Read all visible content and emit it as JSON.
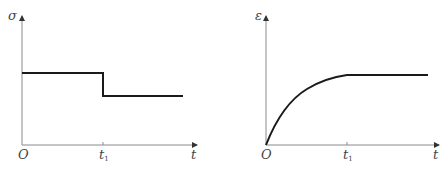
{
  "diagram": {
    "panels": [
      {
        "id": "stress",
        "y_axis_label": "σ",
        "x_axis_label": "t",
        "origin_label": "O",
        "tick_label": "t",
        "tick_subscript": "1",
        "description": "Stress: constant level, then step drop at t1 to a lower constant level"
      },
      {
        "id": "strain",
        "y_axis_label": "ε",
        "x_axis_label": "t",
        "origin_label": "O",
        "tick_label": "t",
        "tick_subscript": "1",
        "description": "Strain: concave increasing curve from origin up to t1, then constant"
      }
    ],
    "colors": {
      "axis": "#8a8a8a",
      "curve": "#1a1a1a",
      "label": "#444444"
    }
  }
}
